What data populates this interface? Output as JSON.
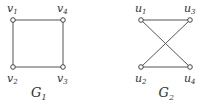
{
  "graphs": [
    {
      "caption": {
        "letter": "G",
        "sub": "1"
      },
      "nodes": [
        {
          "id": "v1",
          "letter": "v",
          "sub": "1",
          "x": 13,
          "y": 20,
          "label_pos": "above"
        },
        {
          "id": "v4",
          "letter": "v",
          "sub": "4",
          "x": 63,
          "y": 20,
          "label_pos": "above"
        },
        {
          "id": "v2",
          "letter": "v",
          "sub": "2",
          "x": 13,
          "y": 67,
          "label_pos": "below"
        },
        {
          "id": "v3",
          "letter": "v",
          "sub": "3",
          "x": 63,
          "y": 67,
          "label_pos": "below"
        }
      ],
      "edges": [
        [
          "v1",
          "v4"
        ],
        [
          "v1",
          "v2"
        ],
        [
          "v4",
          "v3"
        ],
        [
          "v2",
          "v3"
        ]
      ]
    },
    {
      "caption": {
        "letter": "G",
        "sub": "2"
      },
      "nodes": [
        {
          "id": "u1",
          "letter": "u",
          "sub": "1",
          "x": 141,
          "y": 20,
          "label_pos": "above"
        },
        {
          "id": "u3",
          "letter": "u",
          "sub": "3",
          "x": 190,
          "y": 20,
          "label_pos": "above"
        },
        {
          "id": "u2",
          "letter": "u",
          "sub": "2",
          "x": 141,
          "y": 67,
          "label_pos": "below"
        },
        {
          "id": "u4",
          "letter": "u",
          "sub": "4",
          "x": 190,
          "y": 67,
          "label_pos": "below"
        }
      ],
      "edges": [
        [
          "u1",
          "u3"
        ],
        [
          "u1",
          "u4"
        ],
        [
          "u3",
          "u2"
        ],
        [
          "u2",
          "u4"
        ]
      ]
    }
  ],
  "colors": {
    "edge": "#555555",
    "node_fill": "#ffffff",
    "node_stroke": "#444444",
    "text": "#333333"
  }
}
